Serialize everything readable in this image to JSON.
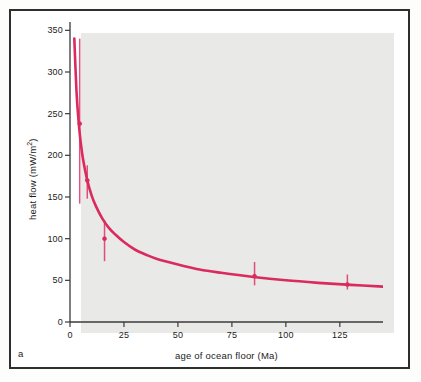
{
  "figure": {
    "panel_label": "a",
    "background_color": "#e9e9e7",
    "frame_color": "#2e2e2e",
    "curve_color": "#d92b5e"
  },
  "chart_data": {
    "type": "line",
    "title": "",
    "subtitle": "",
    "xlabel": "age of ocean floor  (Ma)",
    "ylabel": "heat flow  (mW/m²)",
    "ylabel_text": "heat flow  (mW/m",
    "ylabel_exponent": "2",
    "ylabel_suffix": ")",
    "xlim": [
      0,
      145
    ],
    "ylim": [
      0,
      360
    ],
    "xticks": [
      0,
      25,
      50,
      75,
      100,
      125
    ],
    "yticks": [
      0,
      50,
      100,
      150,
      200,
      250,
      300,
      350
    ],
    "xtick_labels": [
      "0",
      "25",
      "50",
      "75",
      "100",
      "125"
    ],
    "ytick_labels": [
      "0",
      "50",
      "100",
      "150",
      "200",
      "250",
      "300",
      "350"
    ],
    "grid": false,
    "legend": "none",
    "series": [
      {
        "name": "theoretical cooling curve",
        "type": "line",
        "color": "#d92b5e",
        "x": [
          1.0,
          2.0,
          3.0,
          4.0,
          5.0,
          6.0,
          8.0,
          10.0,
          12.0,
          15.0,
          18.0,
          21.0,
          25.0,
          30.0,
          35.0,
          40.0,
          50.0,
          60.0,
          70.0,
          85.0,
          100.0,
          115.0,
          130.0,
          145.0
        ],
        "y": [
          480.0,
          340.0,
          277.0,
          240.0,
          215.0,
          196.0,
          170.0,
          152.0,
          139.0,
          124.0,
          113.0,
          105.0,
          96.0,
          87.0,
          81.0,
          76.0,
          69.0,
          63.0,
          59.0,
          54.0,
          50.0,
          47.0,
          44.5,
          42.5
        ]
      },
      {
        "name": "observed heat flow (mean ± error)",
        "type": "errorbar",
        "color": "#d92b5e",
        "points": [
          {
            "x": 4.5,
            "y": 238,
            "ylow": 142,
            "yhigh": 340
          },
          {
            "x": 8.0,
            "y": 170,
            "ylow": 148,
            "yhigh": 188
          },
          {
            "x": 16.0,
            "y": 100,
            "ylow": 73,
            "yhigh": 122
          },
          {
            "x": 85.5,
            "y": 55,
            "ylow": 44,
            "yhigh": 72
          },
          {
            "x": 128.5,
            "y": 45,
            "ylow": 39,
            "yhigh": 57
          }
        ]
      }
    ]
  }
}
